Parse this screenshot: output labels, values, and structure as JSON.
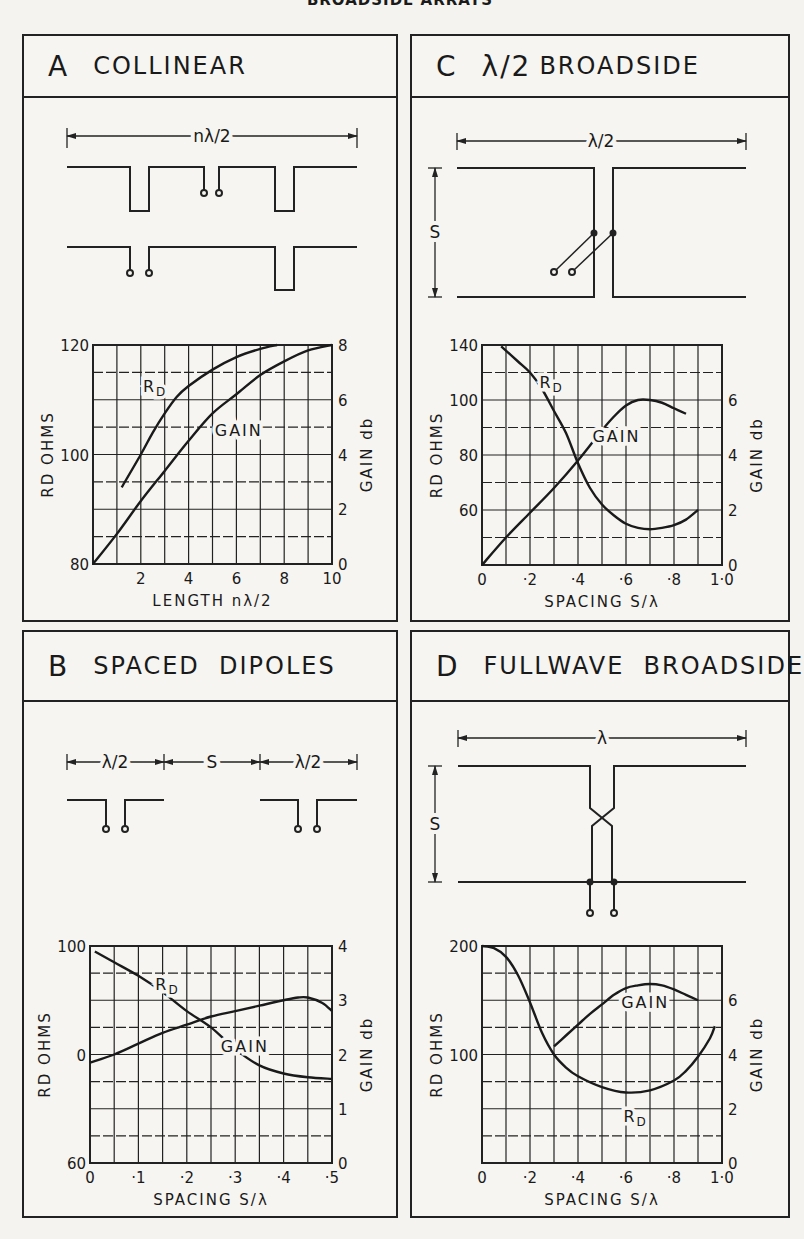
{
  "page": {
    "title": "BROADSIDE ARRAYS"
  },
  "panels": [
    {
      "id": "A",
      "letter": "A",
      "title": "COLLINEAR",
      "prefix": "",
      "dimension_label": "nλ/2"
    },
    {
      "id": "C",
      "letter": "C",
      "title": "BROADSIDE",
      "prefix": "λ/2",
      "dimension_label": "λ/2",
      "spacing_label": "S"
    },
    {
      "id": "B",
      "letter": "B",
      "title": "SPACED  DIPOLES",
      "prefix": "",
      "dimension_labels": [
        "λ/2",
        "S",
        "λ/2"
      ]
    },
    {
      "id": "D",
      "letter": "D",
      "title": "FULLWAVE  BROADSIDE",
      "prefix": "",
      "dimension_label": "λ",
      "spacing_label": "S"
    }
  ],
  "chart_data": [
    {
      "panel": "A",
      "type": "line",
      "title": "COLLINEAR",
      "xlabel": "LENGTH nλ/2",
      "ylabel": "RD OHMS",
      "y2label": "GAIN db",
      "xlim": [
        0,
        10
      ],
      "ylim": [
        80,
        120
      ],
      "y2lim": [
        0,
        8
      ],
      "x_ticks": [
        "2",
        "4",
        "6",
        "8",
        "10"
      ],
      "x_tick_values": [
        2,
        4,
        6,
        8,
        10
      ],
      "y_ticks": [
        "80",
        "100",
        "120"
      ],
      "y_tick_values": [
        80,
        100,
        120
      ],
      "y2_ticks": [
        "0",
        "2",
        "4",
        "6",
        "8"
      ],
      "y2_tick_values": [
        0,
        2,
        4,
        6,
        8
      ],
      "grid": {
        "cols": 10,
        "rows": 8
      },
      "series": [
        {
          "name": "RD",
          "axis": "left",
          "label_at": [
            2.6,
            112.5
          ],
          "x": [
            1.2,
            2,
            2.5,
            3,
            3.5,
            4,
            5,
            6,
            7,
            7.7
          ],
          "values": [
            94,
            100,
            104,
            107.5,
            110.5,
            112.5,
            115.5,
            117.8,
            119.3,
            120
          ]
        },
        {
          "name": "GAIN",
          "axis": "right",
          "label_at": [
            6.1,
            4.9
          ],
          "x": [
            0,
            1,
            2,
            3,
            4,
            5,
            6,
            7,
            8,
            9,
            10
          ],
          "values": [
            0,
            1.1,
            2.3,
            3.4,
            4.5,
            5.5,
            6.2,
            6.9,
            7.4,
            7.8,
            8.0
          ]
        }
      ]
    },
    {
      "panel": "C",
      "type": "line",
      "title": "λ/2 BROADSIDE",
      "xlabel": "SPACING S/λ",
      "ylabel": "RD OHMS",
      "y2label": "GAIN db",
      "xlim": [
        0,
        1.0
      ],
      "ylim": [
        40,
        140
      ],
      "y2lim": [
        0,
        8
      ],
      "x_ticks": [
        "0",
        "·2",
        "·4",
        "·6",
        "·8",
        "1·0"
      ],
      "x_tick_values": [
        0,
        0.2,
        0.4,
        0.6,
        0.8,
        1.0
      ],
      "y_ticks": [
        "60",
        "80",
        "100",
        "140"
      ],
      "y_tick_rows": [
        6,
        4,
        2,
        0
      ],
      "y2_ticks": [
        "0",
        "2",
        "4",
        "6"
      ],
      "y2_tick_values": [
        0,
        2,
        4,
        6
      ],
      "grid": {
        "cols": 10,
        "rows": 8
      },
      "series": [
        {
          "name": "RD",
          "axis": "left",
          "label_at": [
            0.29,
            6.6
          ],
          "x": [
            0.08,
            0.15,
            0.2,
            0.25,
            0.3,
            0.35,
            0.4,
            0.45,
            0.5,
            0.55,
            0.6,
            0.65,
            0.7,
            0.75,
            0.8,
            0.85,
            0.9
          ],
          "row": [
            0.05,
            0.6,
            1.0,
            1.6,
            2.4,
            3.2,
            4.3,
            5.2,
            5.8,
            6.2,
            6.5,
            6.65,
            6.7,
            6.65,
            6.55,
            6.35,
            6.0
          ],
          "values": [
            138,
            132,
            127,
            120,
            110,
            100,
            86,
            75,
            68,
            63,
            59,
            57,
            56,
            57,
            58,
            61,
            65
          ]
        },
        {
          "name": "GAIN",
          "axis": "right",
          "label_at": [
            0.56,
            4.7
          ],
          "x": [
            0,
            0.1,
            0.2,
            0.3,
            0.4,
            0.5,
            0.55,
            0.6,
            0.65,
            0.7,
            0.75,
            0.8,
            0.85
          ],
          "values": [
            0,
            1.0,
            1.9,
            2.8,
            3.8,
            4.9,
            5.4,
            5.8,
            6.0,
            6.0,
            5.9,
            5.7,
            5.5
          ]
        }
      ]
    },
    {
      "panel": "B",
      "type": "line",
      "title": "SPACED DIPOLES",
      "xlabel": "SPACING S/λ",
      "ylabel": "RD OHMS",
      "y2label": "GAIN db",
      "xlim": [
        0,
        0.5
      ],
      "ylim": [
        60,
        100
      ],
      "y2lim": [
        0,
        4
      ],
      "x_ticks": [
        "0",
        "·1",
        "·2",
        "·3",
        "·4",
        "·5"
      ],
      "x_tick_values": [
        0,
        0.1,
        0.2,
        0.3,
        0.4,
        0.5
      ],
      "y_ticks": [
        "60",
        "0",
        "100"
      ],
      "y_tick_rows": [
        8,
        4,
        0
      ],
      "y2_ticks": [
        "0",
        "1",
        "2",
        "3",
        "4"
      ],
      "y2_tick_values": [
        0,
        1,
        2,
        3,
        4
      ],
      "grid": {
        "cols": 10,
        "rows": 8
      },
      "series": [
        {
          "name": "RD",
          "axis": "left",
          "label_at": [
            0.16,
            93
          ],
          "x": [
            0.01,
            0.05,
            0.1,
            0.15,
            0.2,
            0.25,
            0.3,
            0.35,
            0.4,
            0.45,
            0.5
          ],
          "values": [
            99,
            97,
            94.5,
            91.5,
            88,
            85,
            81,
            78,
            76.5,
            75.8,
            75.5
          ]
        },
        {
          "name": "GAIN",
          "axis": "right",
          "label_at": [
            0.32,
            2.15
          ],
          "x": [
            0,
            0.05,
            0.1,
            0.15,
            0.2,
            0.25,
            0.3,
            0.35,
            0.4,
            0.43,
            0.45,
            0.48,
            0.5
          ],
          "values": [
            1.85,
            2.0,
            2.2,
            2.4,
            2.55,
            2.7,
            2.8,
            2.9,
            3.0,
            3.05,
            3.05,
            2.95,
            2.8
          ]
        }
      ]
    },
    {
      "panel": "D",
      "type": "line",
      "title": "FULLWAVE BROADSIDE",
      "xlabel": "SPACING S/λ",
      "ylabel": "RD OHMS",
      "y2label": "GAIN db",
      "xlim": [
        0,
        1.0
      ],
      "ylim": [
        0,
        200
      ],
      "y2lim": [
        0,
        8
      ],
      "x_ticks": [
        "0",
        "·2",
        "·4",
        "·6",
        "·8",
        "1·0"
      ],
      "x_tick_values": [
        0,
        0.2,
        0.4,
        0.6,
        0.8,
        1.0
      ],
      "y_ticks": [
        "100",
        "200"
      ],
      "y_tick_values": [
        100,
        200
      ],
      "y2_ticks": [
        "0",
        "2",
        "4",
        "6"
      ],
      "y2_tick_values": [
        0,
        2,
        4,
        6
      ],
      "grid": {
        "cols": 10,
        "rows": 8
      },
      "series": [
        {
          "name": "RD",
          "axis": "left",
          "label_at": [
            0.64,
            43
          ],
          "x": [
            0,
            0.05,
            0.1,
            0.15,
            0.2,
            0.25,
            0.3,
            0.35,
            0.4,
            0.5,
            0.6,
            0.7,
            0.8,
            0.85,
            0.9,
            0.95,
            0.97
          ],
          "values": [
            200,
            198,
            190,
            173,
            148,
            120,
            100,
            88,
            80,
            70,
            65,
            67,
            76,
            85,
            98,
            115,
            126
          ]
        },
        {
          "name": "GAIN",
          "axis": "right",
          "label_at": [
            0.68,
            5.95
          ],
          "x": [
            0.3,
            0.35,
            0.4,
            0.45,
            0.5,
            0.55,
            0.6,
            0.65,
            0.7,
            0.75,
            0.8,
            0.85,
            0.9
          ],
          "values": [
            4.3,
            4.7,
            5.1,
            5.5,
            5.85,
            6.2,
            6.45,
            6.55,
            6.6,
            6.55,
            6.4,
            6.2,
            6.0
          ]
        }
      ]
    }
  ]
}
